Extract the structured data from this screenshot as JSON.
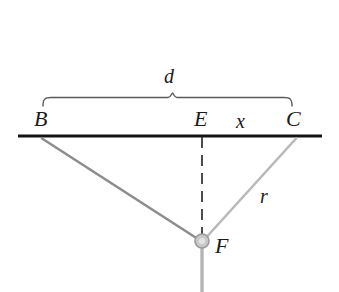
{
  "figure": {
    "type": "geometry-diagram",
    "background_color": "#ffffff",
    "description_labels": {
      "point_b": "B",
      "point_e": "E",
      "point_c": "C",
      "point_f": "F",
      "segment_d": "d",
      "segment_x": "x",
      "segment_r": "r"
    },
    "colors": {
      "baseline": "#141414",
      "label_text": "#1b1b1b",
      "brace": "#5a5a5a",
      "line_bf": "#8d8d8d",
      "line_cf": "#b9b9b9",
      "dashed_line": "#3a3a3a",
      "node_fill": "#c9c9c9",
      "node_stroke": "#9a9a9a",
      "stem_below_f": "#b5b5b5"
    },
    "geometry": {
      "baseline": {
        "x1": 18,
        "y1": 136,
        "x2": 322,
        "y2": 136,
        "width": 3
      },
      "point_b": {
        "x": 42,
        "y": 136
      },
      "point_e": {
        "x": 202,
        "y": 136
      },
      "point_c": {
        "x": 296,
        "y": 136
      },
      "point_f": {
        "x": 202,
        "y": 241
      },
      "node_radius": 7,
      "brace": {
        "left_x": 43,
        "right_x": 292,
        "bar_y": 98,
        "tip_y": 106,
        "peak_x": 172,
        "peak_y": 93
      },
      "stem_below_f": {
        "x": 202,
        "y_start": 248,
        "y_end": 292
      }
    },
    "label_positions": {
      "d": {
        "x": 164,
        "y": 66
      },
      "b": {
        "x": 34,
        "y": 108
      },
      "e": {
        "x": 194,
        "y": 108
      },
      "x": {
        "x": 236,
        "y": 110
      },
      "c": {
        "x": 286,
        "y": 108
      },
      "r": {
        "x": 260,
        "y": 186
      },
      "f": {
        "x": 215,
        "y": 234
      }
    }
  }
}
